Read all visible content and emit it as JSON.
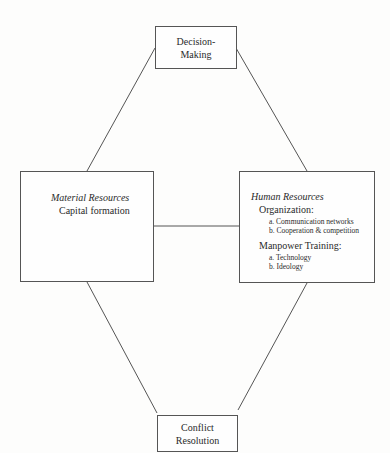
{
  "diagram": {
    "nodes": {
      "top": {
        "line1": "Decision-",
        "line2": "Making"
      },
      "bottom": {
        "line1": "Conflict",
        "line2": "Resolution"
      },
      "left": {
        "title": "Material Resources",
        "item": "Capital formation"
      },
      "right": {
        "title": "Human Resources",
        "org_heading": "Organization:",
        "org_items": [
          "a.  Communication networks",
          "b.  Cooperation & competition"
        ],
        "mp_heading": "Manpower Training:",
        "mp_items": [
          "a.  Technology",
          "b.  Ideology"
        ]
      }
    },
    "edges": [
      {
        "from": "top",
        "to": "left"
      },
      {
        "from": "top",
        "to": "right"
      },
      {
        "from": "left",
        "to": "right"
      },
      {
        "from": "left",
        "to": "bottom"
      },
      {
        "from": "right",
        "to": "bottom"
      }
    ],
    "colors": {
      "line": "#555555",
      "text": "#2a2a2a",
      "background": "#fdfdfc"
    }
  }
}
